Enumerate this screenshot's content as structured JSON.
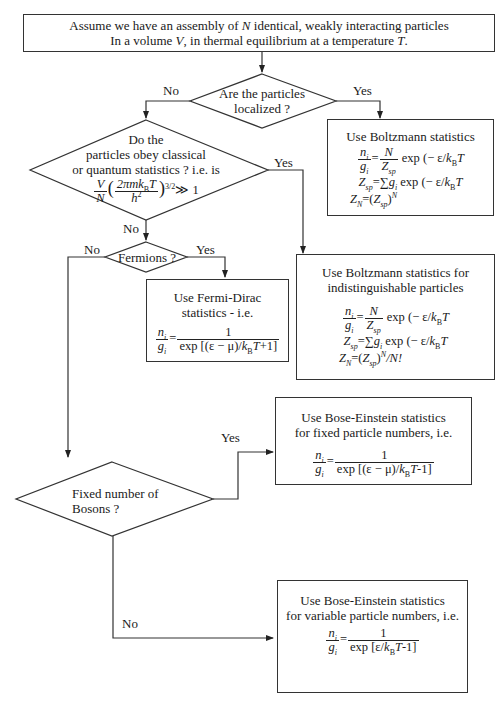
{
  "start": {
    "line1_pre": "Assume we have an assembly of ",
    "line1_var": "N",
    "line1_post": " identical, weakly interacting particles",
    "line2_pre": "In a volume ",
    "line2_var": "V",
    "line2_mid": ", in thermal equilibrium at a temperature ",
    "line2_var2": "T",
    "line2_end": "."
  },
  "decision_localized": {
    "line1": "Are the particles",
    "line2": "localized ?",
    "no_label": "No",
    "yes_label": "Yes"
  },
  "decision_classical": {
    "line1": "Do the",
    "line2": "particles obey classical",
    "line3": "or quantum statistics ?  i.e.  is",
    "criterion": "(V/N)(2πmk_B T/h²)^{3/2} ≫ 1",
    "yes_label": "Yes",
    "no_label": "No"
  },
  "decision_fermions": {
    "text": "Fermions ?",
    "no_label": "No",
    "yes_label": "Yes"
  },
  "decision_bosons": {
    "line1": "Fixed number of",
    "line2": "Bosons ?",
    "yes_label": "Yes",
    "no_label": "No"
  },
  "box_boltzmann": {
    "title": "Use Boltzmann statistics",
    "eq1": "n_i/g_i = N/Z_sp exp(−ε/k_B T)",
    "eq2": "Z_sp = Σ_i g_i exp(−ε/k_B T)",
    "eq3": "Z_N = (Z_sp)^N"
  },
  "box_boltzmann_indist": {
    "title_line1": "Use Boltzmann statistics for",
    "title_line2": "indistinguishable particles",
    "eq1": "n_i/g_i = N/Z_sp exp(−ε/k_B T)",
    "eq2": "Z_sp = Σ_i g_i exp(−ε/k_B T)",
    "eq3": "Z_N = (Z_sp)^N / N!"
  },
  "box_fermi_dirac": {
    "title_line1": "Use Fermi-Dirac",
    "title_line2": "statistics - i.e.",
    "eq": "n_i/g_i = 1 / (exp[(ε−μ)/k_B T] + 1)"
  },
  "box_bose_fixed": {
    "title_line1": "Use Bose-Einstein statistics",
    "title_line2": "for fixed particle numbers, i.e.",
    "eq": "n_i/g_i = 1 / (exp[(ε−μ)/k_B T] − 1)"
  },
  "box_bose_variable": {
    "title_line1": "Use Bose-Einstein statistics",
    "title_line2": "for variable  particle numbers, i.e.",
    "eq": "n_i/g_i = 1 / (exp[ε/k_B T] − 1)"
  },
  "symbols": {
    "n": "n",
    "g": "g",
    "i": "i",
    "N": "N",
    "Z": "Z",
    "sp": "sp",
    "k": "k",
    "B": "B",
    "T": "T",
    "one": "1",
    "equals": "=",
    "exp": "exp",
    "sum": "∑",
    "eps": "ε",
    "mu": "μ",
    "V": "V",
    "h": "h",
    "twopimk": "2πmk",
    "three_half": "3/2",
    "gg1": "≫ 1",
    "open_minus": "(− ",
    "slash": "/",
    "fd_den_pre": "exp [(ε − μ)/",
    "plus1": "+1]",
    "be_den_pre": "exp [(ε − μ)/",
    "minus1": "-1]",
    "bev_den_pre": "exp [ε/",
    "Nfact": "/N!"
  },
  "colors": {
    "line": "#333333",
    "text": "#1a1a1a",
    "background": "#ffffff"
  }
}
